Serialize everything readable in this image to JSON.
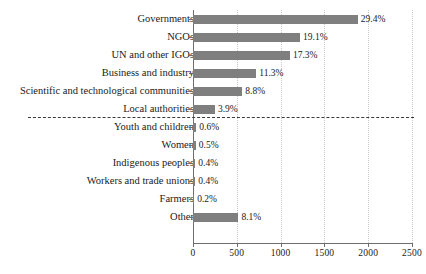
{
  "chart_data": {
    "type": "bar",
    "orientation": "horizontal",
    "title": "",
    "xlabel": "",
    "ylabel": "",
    "xlim": [
      0,
      2500
    ],
    "xticks": [
      0,
      500,
      1000,
      1500,
      2000,
      2500
    ],
    "xtick_labels": [
      "0",
      "500",
      "1000",
      "1500",
      "2000",
      "2500"
    ],
    "grid": "vertical-dotted",
    "legend": "none",
    "bar_color": "#7f7f7f",
    "categories": [
      "Governments",
      "NGOs",
      "UN and other IGOs",
      "Business and industry",
      "Scientific and technological communities",
      "Local authorities",
      "Youth and children",
      "Women",
      "Indigenous peoples",
      "Workers and trade unions",
      "Farmers",
      "Other"
    ],
    "values": [
      1882,
      1222,
      1107,
      723,
      563,
      250,
      38,
      32,
      26,
      26,
      13,
      518
    ],
    "data_labels": [
      "29.4%",
      "19.1%",
      "17.3%",
      "11.3%",
      "8.8%",
      "3.9%",
      "0.6%",
      "0.5%",
      "0.4%",
      "0.4%",
      "0.2%",
      "8.1%"
    ],
    "percentages": [
      29.4,
      19.1,
      17.3,
      11.3,
      8.8,
      3.9,
      0.6,
      0.5,
      0.4,
      0.4,
      0.2,
      8.1
    ],
    "annotations": [
      {
        "type": "dashed-separator",
        "after_category": "Local authorities",
        "color": "#3a3a3a",
        "style": "dashed"
      }
    ]
  }
}
